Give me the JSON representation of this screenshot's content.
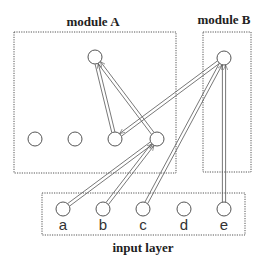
{
  "diagram": {
    "modules": [
      {
        "id": "moduleA",
        "label": "module A",
        "box": [
          14,
          32,
          176,
          173
        ],
        "label_pos": [
          93,
          26
        ]
      },
      {
        "id": "moduleB",
        "label": "module B",
        "box": [
          203,
          32,
          251,
          172
        ],
        "label_pos": [
          224,
          24
        ]
      },
      {
        "id": "input",
        "label": "input layer",
        "box": [
          42,
          193,
          245,
          235
        ],
        "label_pos": [
          143,
          252
        ]
      }
    ],
    "nodes": [
      {
        "id": "A_top",
        "x": 95,
        "y": 57,
        "label": ""
      },
      {
        "id": "A1",
        "x": 35,
        "y": 139,
        "label": ""
      },
      {
        "id": "A2",
        "x": 75,
        "y": 139,
        "label": ""
      },
      {
        "id": "A3",
        "x": 115,
        "y": 139,
        "label": ""
      },
      {
        "id": "A4",
        "x": 157,
        "y": 139,
        "label": ""
      },
      {
        "id": "B",
        "x": 224,
        "y": 58,
        "label": ""
      },
      {
        "id": "a",
        "x": 63,
        "y": 209,
        "label": "a"
      },
      {
        "id": "b",
        "x": 103,
        "y": 209,
        "label": "b"
      },
      {
        "id": "c",
        "x": 143,
        "y": 209,
        "label": "c"
      },
      {
        "id": "d",
        "x": 184,
        "y": 209,
        "label": "d"
      },
      {
        "id": "e",
        "x": 224,
        "y": 209,
        "label": "e"
      }
    ],
    "edges": [
      {
        "from": "a",
        "to": "A4"
      },
      {
        "from": "b",
        "to": "A4"
      },
      {
        "from": "c",
        "to": "B"
      },
      {
        "from": "e",
        "to": "B"
      },
      {
        "from": "A3",
        "to": "A_top"
      },
      {
        "from": "A4",
        "to": "A_top"
      },
      {
        "from": "B",
        "to": "A3"
      }
    ],
    "edge_style": "double-line arrows",
    "node_radius": 7
  }
}
